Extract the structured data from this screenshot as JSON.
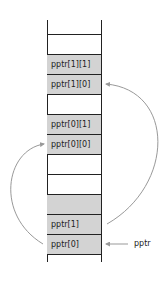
{
  "diagram": {
    "cells": [
      {
        "label": "",
        "filled": false
      },
      {
        "label": "",
        "filled": false
      },
      {
        "label": "pptr[1][1]",
        "filled": true
      },
      {
        "label": "pptr[1][0]",
        "filled": true
      },
      {
        "label": "",
        "filled": false
      },
      {
        "label": "pptr[0][1]",
        "filled": true
      },
      {
        "label": "pptr[0][0]",
        "filled": true
      },
      {
        "label": "",
        "filled": false
      },
      {
        "label": "",
        "filled": false
      },
      {
        "label": "",
        "filled": true
      },
      {
        "label": "pptr[1]",
        "filled": true
      },
      {
        "label": "pptr[0]",
        "filled": true
      }
    ],
    "pointer_label": "pptr",
    "colors": {
      "line": "#222222",
      "fill": "#d3d3d3",
      "arrow": "#999999"
    }
  }
}
